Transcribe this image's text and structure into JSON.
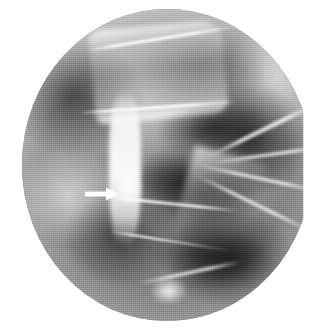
{
  "figure": {
    "type": "radiograph",
    "modality": "plain-film X-ray",
    "view": "coned-down lateral spine",
    "field_shape": "circular collimated field",
    "background_color": "#ffffff",
    "field_tone_dark": "#222222",
    "field_tone_mid": "#8e8e8e",
    "field_tone_light": "#f2f2f2",
    "caption": "",
    "title": ""
  },
  "field": {
    "center_x_px": 167,
    "center_y_px": 165,
    "radius_x_px": 145,
    "radius_y_px": 156,
    "left_edge_px": 22,
    "right_edge_px": 312,
    "top_edge_px": 9,
    "bottom_edge_px": 321
  },
  "annotations": [
    {
      "name": "arrow-marker",
      "kind": "arrow",
      "direction": "right",
      "color": "#ffffff",
      "label": "",
      "tail_x_px": 85,
      "tail_y_px": 194,
      "tip_x_px": 115,
      "tip_y_px": 194,
      "length_px": 30,
      "shaft_thickness_px": 5,
      "head_width_px": 13,
      "head_height_px": 15,
      "points_to": "anterior cortical margin of vertebral body"
    }
  ],
  "structures": [
    {
      "name": "upper-vertebral-body",
      "tone": "bright",
      "region": "upper-centre"
    },
    {
      "name": "superior-endplate",
      "tone": "bright",
      "region": "top-centre"
    },
    {
      "name": "mid-endplate",
      "tone": "bright",
      "region": "centre"
    },
    {
      "name": "inferior-endplate",
      "tone": "bright",
      "region": "lower-centre"
    },
    {
      "name": "intervertebral-disc-upper",
      "tone": "dark",
      "region": "upper-right-centre"
    },
    {
      "name": "intervertebral-disc-mid",
      "tone": "dark",
      "region": "centre"
    },
    {
      "name": "intervertebral-disc-lower",
      "tone": "dark",
      "region": "lower-centre"
    },
    {
      "name": "anterior-cortical-margin",
      "tone": "bright",
      "region": "left-centre"
    },
    {
      "name": "cortical-step-off",
      "tone": "bright",
      "region": "left-centre"
    },
    {
      "name": "posterior-elements",
      "tone": "mixed",
      "region": "right"
    },
    {
      "name": "rib-shadow-1",
      "tone": "bright",
      "region": "right-upper"
    },
    {
      "name": "rib-shadow-2",
      "tone": "bright",
      "region": "right"
    },
    {
      "name": "rib-shadow-3",
      "tone": "bright",
      "region": "right"
    },
    {
      "name": "rib-shadow-4",
      "tone": "bright",
      "region": "right-lower"
    },
    {
      "name": "rib-shadow-5",
      "tone": "bright",
      "region": "top-right"
    },
    {
      "name": "rib-shadow-6",
      "tone": "bright",
      "region": "bottom-centre"
    },
    {
      "name": "bright-focus",
      "tone": "bright",
      "region": "bottom-centre"
    }
  ]
}
